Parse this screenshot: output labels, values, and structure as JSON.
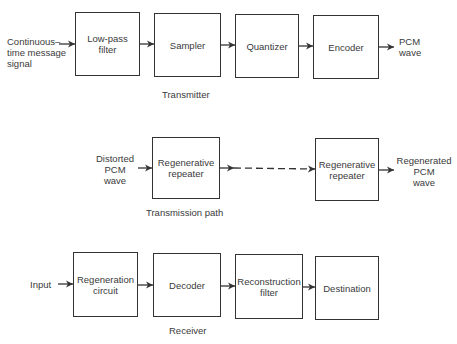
{
  "transmitter": {
    "caption": "Transmitter",
    "input_label": "Continuous–\ntime message\nsignal",
    "output_label": "PCM\nwave",
    "blocks": [
      "Low-pass\nfilter",
      "Sampler",
      "Quantizer",
      "Encoder"
    ]
  },
  "transmission_path": {
    "caption": "Transmission path",
    "input_label": "Distorted\nPCM\nwave",
    "output_label": "Regenerated\nPCM\nwave",
    "blocks": [
      "Regenerative\nrepeater",
      "Regenerative\nrepeater"
    ]
  },
  "receiver": {
    "caption": "Receiver",
    "input_label": "Input",
    "blocks": [
      "Regeneration\ncircuit",
      "Decoder",
      "Reconstruction\nfilter",
      "Destination"
    ]
  }
}
